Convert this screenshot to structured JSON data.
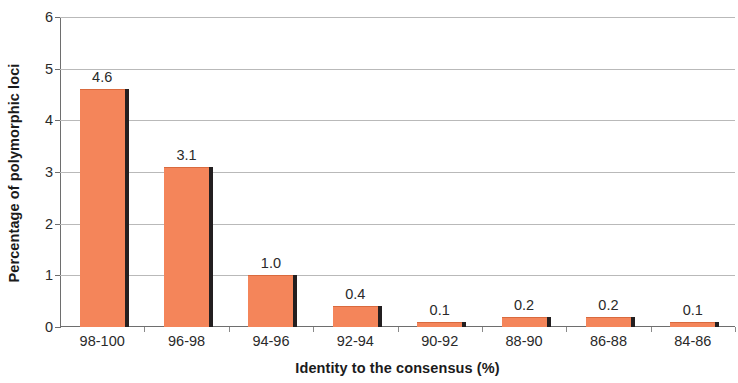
{
  "chart_data": {
    "type": "bar",
    "title": "",
    "subtitle": "",
    "xlabel": "Identity to the consensus (%)",
    "ylabel": "Percentage of polymorphic loci",
    "categories": [
      "98-100",
      "96-98",
      "94-96",
      "92-94",
      "90-92",
      "88-90",
      "86-88",
      "84-86"
    ],
    "values": [
      4.6,
      3.1,
      1.0,
      0.4,
      0.1,
      0.2,
      0.2,
      0.1
    ],
    "data_labels": [
      "4.6",
      "3.1",
      "1.0",
      "0.4",
      "0.1",
      "0.2",
      "0.2",
      "0.1"
    ],
    "ylim": [
      0,
      6
    ],
    "y_ticks": [
      0,
      1,
      2,
      3,
      4,
      5,
      6
    ],
    "y_tick_labels": [
      "0",
      "1",
      "2",
      "3",
      "4",
      "5",
      "6"
    ],
    "grid": true,
    "grid_axis": "y",
    "legend": false,
    "legend_position": "none",
    "series": [
      {
        "name": "Percentage of polymorphic loci",
        "values": [
          4.6,
          3.1,
          1.0,
          0.4,
          0.1,
          0.2,
          0.2,
          0.1
        ]
      }
    ],
    "colors": {
      "bar_fill": "#f4855a",
      "bar_shadow": "#231f20",
      "gridline": "#b9b9b9",
      "axis": "#6e6e6e",
      "text": "#2a2a2a",
      "background": "#ffffff"
    }
  }
}
